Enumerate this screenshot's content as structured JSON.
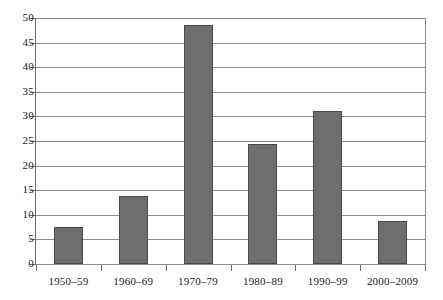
{
  "chart_data": {
    "type": "bar",
    "title": "",
    "subtitle": "",
    "xlabel": "",
    "ylabel": "",
    "categories": [
      "1950–59",
      "1960–69",
      "1970–79",
      "1980–89",
      "1990–99",
      "2000–2009"
    ],
    "values": [
      7.5,
      13.9,
      48.6,
      24.4,
      31.0,
      8.8
    ],
    "series": [
      {
        "name": "",
        "values": [
          7.5,
          13.9,
          48.6,
          24.4,
          31.0,
          8.8
        ]
      }
    ],
    "ylim": [
      0,
      50
    ],
    "ytick_labels": [
      "0",
      "5",
      "10",
      "15",
      "20",
      "25",
      "30",
      "35",
      "40",
      "45",
      "50"
    ],
    "ytick_values": [
      0,
      5,
      10,
      15,
      20,
      25,
      30,
      35,
      40,
      45,
      50
    ],
    "ytick_step": 5,
    "grid": "horizontal",
    "legend": "none",
    "annotations": [],
    "colors": {
      "bar_fill": "#6e6e6e",
      "bar_edge": "#4a4a4a",
      "gridline": "#8c8c8c",
      "axis": "#6b6b6b",
      "background": "#ffffff",
      "text": "#1a1a1a"
    }
  }
}
